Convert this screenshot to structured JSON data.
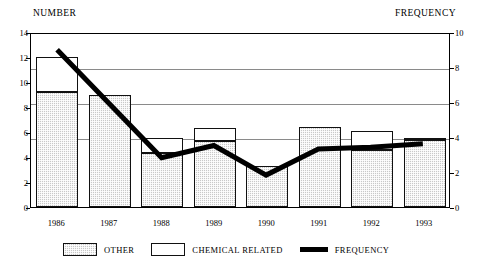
{
  "chart_data": {
    "type": "bar",
    "title": "",
    "subtitle": "",
    "xlabel": "",
    "ylabel": "NUMBER",
    "y2label": "FREQUENCY",
    "categories": [
      "1986",
      "1987",
      "1988",
      "1989",
      "1990",
      "1991",
      "1992",
      "1993"
    ],
    "ylim": [
      0,
      14
    ],
    "yticks": [
      0,
      2,
      4,
      6,
      8,
      10,
      12,
      14
    ],
    "y2lim": [
      0,
      10
    ],
    "y2ticks": [
      0,
      2,
      4,
      6,
      8,
      10
    ],
    "grid": true,
    "grid_axis": "y2",
    "gridline_values_y2": [
      4,
      6,
      8
    ],
    "legend_position": "bottom",
    "stacked": true,
    "series": [
      {
        "name": "OTHER",
        "axis": "left",
        "type": "bar",
        "color": "#c9c9c9",
        "values": [
          9.2,
          9.0,
          4.3,
          5.3,
          3.3,
          6.4,
          4.6,
          5.4
        ]
      },
      {
        "name": "CHEMICAL RELATED",
        "axis": "left",
        "type": "bar",
        "color": "#ffffff",
        "values": [
          2.8,
          0.0,
          1.2,
          1.0,
          0.0,
          0.0,
          1.5,
          0.1
        ]
      },
      {
        "name": "FREQUENCY",
        "axis": "right",
        "type": "line",
        "color": "#000000",
        "values": [
          9.1,
          6.0,
          2.9,
          3.6,
          1.9,
          3.4,
          3.5,
          3.7
        ]
      }
    ],
    "totals": [
      12.0,
      9.0,
      5.5,
      6.3,
      3.3,
      6.4,
      6.1,
      5.5
    ]
  },
  "axes": {
    "left_title": "NUMBER",
    "right_title": "FREQUENCY",
    "left_ticks": [
      "14",
      "12",
      "10",
      "8",
      "6",
      "4",
      "2",
      "0"
    ],
    "right_ticks": [
      "10",
      "8",
      "6",
      "4",
      "2",
      "0"
    ]
  },
  "legend": {
    "items": [
      {
        "label": "OTHER",
        "swatch": "other-swatch"
      },
      {
        "label": "CHEMICAL RELATED",
        "swatch": "chemical-related-swatch"
      },
      {
        "label": "FREQUENCY",
        "swatch": "frequency-line-swatch"
      }
    ]
  }
}
